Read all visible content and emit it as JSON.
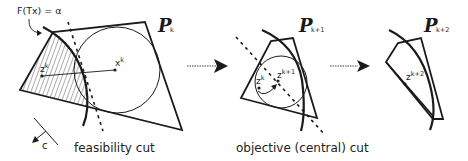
{
  "panels": [
    {
      "id": "k",
      "title": "P",
      "subscript": "k",
      "points": [
        {
          "label": "z",
          "sup": "k"
        },
        {
          "label": "x",
          "sup": "k"
        }
      ],
      "curve_label": "F(Tx) = α",
      "caption": "feasibility cut"
    },
    {
      "id": "k+1",
      "title": "P",
      "subscript": "k+1",
      "points": [
        {
          "label": "z",
          "sup": "k"
        },
        {
          "label": "z",
          "sup": "k+1"
        }
      ],
      "caption": "objective (central) cut"
    },
    {
      "id": "k+2",
      "title": "P",
      "subscript": "k+2",
      "points": [
        {
          "label": "z",
          "sup": "k+2"
        }
      ]
    }
  ],
  "direction_label": "c",
  "colors": {
    "stroke": "#1a1a1a",
    "background": "#ffffff"
  }
}
